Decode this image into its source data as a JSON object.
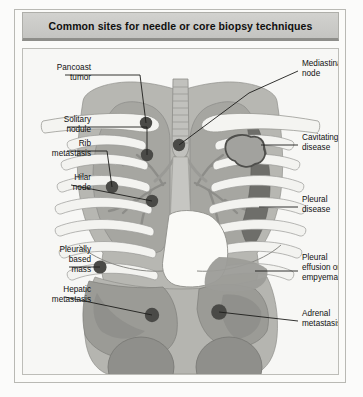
{
  "figure": {
    "title": "Common sites for needle or core biopsy techniques",
    "colors": {
      "page_background": "#fbfbfa",
      "panel_background": "#f7f7f5",
      "title_bar": "#cbcbc8",
      "frame_border": "#b9b9b4",
      "soft_tissue": "#b9b9b4",
      "lung_field": "#a9a9a4",
      "organ_mid": "#9d9d98",
      "organ_dark": "#868682",
      "pleural_disease": "#6f6f6b",
      "lesion_marker": "#4a4a47",
      "bone_light": "#f3f3f0",
      "leader_line": "#1d1d1b",
      "text": "#111111"
    }
  },
  "labels": {
    "left": [
      {
        "id": "pancoast-tumor",
        "lines": [
          "Pancoast",
          "tumor"
        ]
      },
      {
        "id": "solitary-nodule",
        "lines": [
          "Solitary",
          "nodule"
        ]
      },
      {
        "id": "rib-metastasis",
        "lines": [
          "Rib",
          "metastasis"
        ]
      },
      {
        "id": "hilar-node",
        "lines": [
          "Hilar",
          "node"
        ]
      },
      {
        "id": "pleurally-based-mass",
        "lines": [
          "Pleurally",
          "based",
          "mass"
        ]
      },
      {
        "id": "hepatic-metastasis",
        "lines": [
          "Hepatic",
          "metastasis"
        ]
      }
    ],
    "right": [
      {
        "id": "mediastinal-node",
        "lines": [
          "Mediastinal",
          "node"
        ]
      },
      {
        "id": "cavitating-disease",
        "lines": [
          "Cavitating",
          "disease"
        ]
      },
      {
        "id": "pleural-disease",
        "lines": [
          "Pleural",
          "disease"
        ]
      },
      {
        "id": "pleural-effusion-or-empyema",
        "lines": [
          "Pleural",
          "effusion or",
          "empyema"
        ]
      },
      {
        "id": "adrenal-metastasis",
        "lines": [
          "Adrenal",
          "metastasis"
        ]
      }
    ]
  },
  "anatomy_parts": [
    "trachea",
    "left-lung",
    "right-lung",
    "clavicle-left",
    "clavicle-right",
    "ribs-left",
    "ribs-right",
    "heart",
    "diaphragm",
    "liver",
    "stomach-spleen",
    "kidney-left",
    "kidney-right",
    "ureter-left",
    "ureter-right",
    "pulmonary-vessels-left",
    "pulmonary-vessels-right",
    "spine",
    "pelvis"
  ],
  "lesion_markers": [
    {
      "id": "pancoast-tumor-marker",
      "shape": "filled-circle"
    },
    {
      "id": "solitary-nodule-marker",
      "shape": "filled-circle"
    },
    {
      "id": "rib-metastasis-marker",
      "shape": "filled-circle"
    },
    {
      "id": "hilar-node-marker",
      "shape": "filled-circle"
    },
    {
      "id": "mediastinal-node-marker",
      "shape": "filled-circle"
    },
    {
      "id": "pleurally-based-mass-marker",
      "shape": "filled-circle"
    },
    {
      "id": "hepatic-metastasis-marker",
      "shape": "filled-circle"
    },
    {
      "id": "adrenal-metastasis-marker",
      "shape": "filled-circle"
    },
    {
      "id": "cavitating-disease-lesion",
      "shape": "irregular-ring"
    },
    {
      "id": "pleural-disease-region",
      "shape": "crescent-shading"
    },
    {
      "id": "pleural-effusion-region",
      "shape": "basal-shading"
    }
  ]
}
